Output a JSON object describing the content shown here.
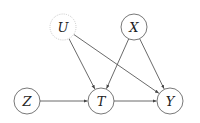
{
  "diagram": {
    "type": "causal-dag",
    "nodes": [
      {
        "id": "U",
        "label": "U",
        "cx": 63,
        "cy": 27,
        "r": 13,
        "style": "dotted",
        "stroke": "#c8c8c8"
      },
      {
        "id": "X",
        "label": "X",
        "cx": 134,
        "cy": 27,
        "r": 13,
        "style": "solid",
        "stroke": "#555555"
      },
      {
        "id": "Z",
        "label": "Z",
        "cx": 27,
        "cy": 101,
        "r": 13,
        "style": "solid",
        "stroke": "#555555"
      },
      {
        "id": "T",
        "label": "T",
        "cx": 101,
        "cy": 101,
        "r": 13,
        "style": "solid",
        "stroke": "#555555"
      },
      {
        "id": "Y",
        "label": "Y",
        "cx": 170,
        "cy": 101,
        "r": 13,
        "style": "solid",
        "stroke": "#555555"
      }
    ],
    "edges": [
      {
        "from": "U",
        "to": "T"
      },
      {
        "from": "U",
        "to": "Y"
      },
      {
        "from": "X",
        "to": "T"
      },
      {
        "from": "X",
        "to": "Y"
      },
      {
        "from": "Z",
        "to": "T"
      },
      {
        "from": "T",
        "to": "Y"
      }
    ]
  }
}
